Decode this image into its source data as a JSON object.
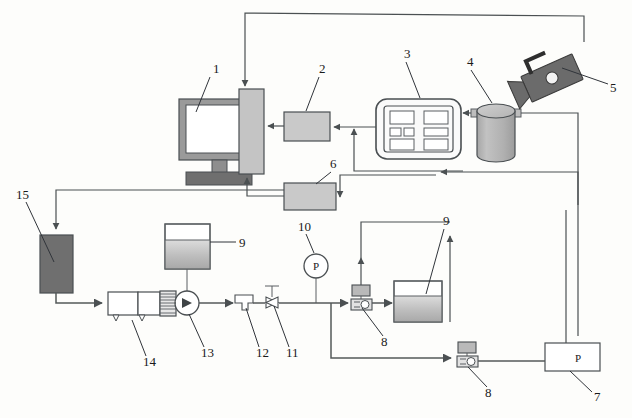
{
  "figure": {
    "type": "process-flow-diagram",
    "width": 632,
    "height": 418,
    "background_color": "#fdfdfb"
  },
  "colors": {
    "line": "#54595a",
    "leader": "#30343a",
    "box_fill": "#c9c9c9",
    "dark_fill": "#6f6f6f",
    "screen_fill": "#ffffff",
    "bezel_fill": "#9a9a9a",
    "tower_fill": "#c4c4c4",
    "cylinder_fill": "#b5b5b5",
    "camera_fill": "#6b6b6b",
    "liquid_top": "#d6d6d6",
    "liquid_bottom": "#aeaeae",
    "valve_coil_fill": "#b9b9b9"
  },
  "callouts": [
    {
      "id": "c1",
      "label": "1",
      "x": 213,
      "y": 70,
      "target_x": 196,
      "target_y": 112,
      "component": "display-monitor"
    },
    {
      "id": "c2",
      "label": "2",
      "x": 322,
      "y": 70,
      "target_x": 307,
      "target_y": 112,
      "component": "signal-conditioner"
    },
    {
      "id": "c3",
      "label": "3",
      "x": 408,
      "y": 55,
      "target_x": 422,
      "target_y": 102,
      "component": "control-panel"
    },
    {
      "id": "c4",
      "label": "4",
      "x": 470,
      "y": 62,
      "target_x": 495,
      "target_y": 102,
      "component": "test-vessel"
    },
    {
      "id": "c5",
      "label": "5",
      "x": 614,
      "y": 88,
      "target_x": 560,
      "target_y": 68,
      "component": "high-speed-camera"
    },
    {
      "id": "c6",
      "label": "6",
      "x": 333,
      "y": 166,
      "target_x": 316,
      "target_y": 186,
      "component": "data-acquisition-unit"
    },
    {
      "id": "c7",
      "label": "7",
      "x": 597,
      "y": 398,
      "target_x": 572,
      "target_y": 370,
      "component": "pressure-controller"
    },
    {
      "id": "c8a",
      "label": "8",
      "x": 385,
      "y": 343,
      "target_x": 361,
      "target_y": 304,
      "component": "solenoid-valve-upper"
    },
    {
      "id": "c8b",
      "label": "8",
      "x": 489,
      "y": 394,
      "target_x": 467,
      "target_y": 362,
      "component": "solenoid-valve-lower"
    },
    {
      "id": "c9a",
      "label": "9",
      "x": 240,
      "y": 245,
      "target_x": 198,
      "target_y": 252,
      "component": "reservoir-tank-left"
    },
    {
      "id": "c9b",
      "label": "9",
      "x": 447,
      "y": 222,
      "target_x": 428,
      "target_y": 272,
      "component": "reservoir-tank-right"
    },
    {
      "id": "c10",
      "label": "10",
      "x": 303,
      "y": 228,
      "target_x": 316,
      "target_y": 255,
      "component": "pressure-gauge"
    },
    {
      "id": "c11",
      "label": "11",
      "x": 291,
      "y": 355,
      "target_x": 272,
      "target_y": 303,
      "component": "shutoff-valve"
    },
    {
      "id": "c12",
      "label": "12",
      "x": 261,
      "y": 355,
      "target_x": 245,
      "target_y": 305,
      "component": "inline-filter"
    },
    {
      "id": "c13",
      "label": "13",
      "x": 206,
      "y": 355,
      "target_x": 189,
      "target_y": 312,
      "component": "pump"
    },
    {
      "id": "c14",
      "label": "14",
      "x": 148,
      "y": 364,
      "target_x": 130,
      "target_y": 322,
      "component": "air-compressor"
    },
    {
      "id": "c15",
      "label": "15",
      "x": 22,
      "y": 196,
      "target_x": 52,
      "target_y": 258,
      "component": "heat-exchanger"
    }
  ],
  "components": [
    {
      "id": "display-monitor",
      "name": "Display monitor",
      "callout": "1",
      "shape": "monitor"
    },
    {
      "id": "computer-tower",
      "name": "Computer tower",
      "callout": "1",
      "shape": "tower"
    },
    {
      "id": "signal-conditioner",
      "name": "Signal conditioner",
      "callout": "2",
      "shape": "box"
    },
    {
      "id": "control-panel",
      "name": "Control panel",
      "callout": "3",
      "shape": "panel"
    },
    {
      "id": "test-vessel",
      "name": "Test vessel",
      "callout": "4",
      "shape": "cylinder"
    },
    {
      "id": "high-speed-camera",
      "name": "High-speed camera",
      "callout": "5",
      "shape": "camera"
    },
    {
      "id": "data-acquisition-unit",
      "name": "Data acquisition unit",
      "callout": "6",
      "shape": "box"
    },
    {
      "id": "pressure-controller",
      "name": "Pressure controller",
      "callout": "7",
      "shape": "box-labeled",
      "inner_label": "P"
    },
    {
      "id": "solenoid-valve-upper",
      "name": "Solenoid valve",
      "callout": "8",
      "shape": "solenoid-valve"
    },
    {
      "id": "solenoid-valve-lower",
      "name": "Solenoid valve",
      "callout": "8",
      "shape": "solenoid-valve"
    },
    {
      "id": "reservoir-tank-left",
      "name": "Reservoir tank",
      "callout": "9",
      "shape": "tank"
    },
    {
      "id": "reservoir-tank-right",
      "name": "Reservoir tank",
      "callout": "9",
      "shape": "tank"
    },
    {
      "id": "pressure-gauge",
      "name": "Pressure gauge",
      "callout": "10",
      "shape": "gauge",
      "inner_label": "P"
    },
    {
      "id": "shutoff-valve",
      "name": "Shutoff valve",
      "callout": "11",
      "shape": "bowtie-valve"
    },
    {
      "id": "inline-filter",
      "name": "Inline filter",
      "callout": "12",
      "shape": "filter"
    },
    {
      "id": "pump",
      "name": "Pump",
      "callout": "13",
      "shape": "pump"
    },
    {
      "id": "air-compressor",
      "name": "Air compressor",
      "callout": "14",
      "shape": "compressor"
    },
    {
      "id": "heat-exchanger",
      "name": "Heat exchanger",
      "callout": "15",
      "shape": "dark-block"
    }
  ],
  "inner_labels": {
    "pressure_controller": "P",
    "pressure_gauge": "P"
  }
}
